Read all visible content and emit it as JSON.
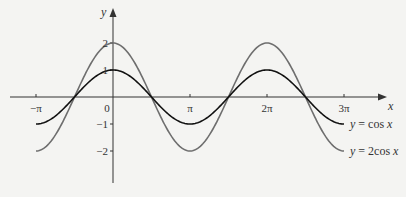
{
  "chart_data": {
    "type": "line",
    "title": "",
    "xlabel": "x",
    "ylabel": "y",
    "xlim_pi": [
      -1.3,
      3.55
    ],
    "ylim": [
      -3.2,
      3.5
    ],
    "grid": false,
    "x_ticks": [
      {
        "value_pi": -1,
        "label": "−π"
      },
      {
        "value_pi": 0,
        "label": "0"
      },
      {
        "value_pi": 1,
        "label": "π"
      },
      {
        "value_pi": 2,
        "label": "2π"
      },
      {
        "value_pi": 3,
        "label": "3π"
      }
    ],
    "y_ticks": [
      {
        "value": 2,
        "label": "2"
      },
      {
        "value": 1,
        "label": "1"
      },
      {
        "value": -1,
        "label": "−1"
      },
      {
        "value": -2,
        "label": "−2"
      }
    ],
    "x_range_pi": [
      -1,
      3
    ],
    "series": [
      {
        "name": "y = cos x",
        "amplitude": 1,
        "color": "#111111",
        "legend": {
          "pre": "y",
          "eq": " = cos",
          "post": "x"
        }
      },
      {
        "name": "y = 2 cos x",
        "amplitude": 2,
        "color": "#6e6e6e",
        "legend": {
          "pre": "y",
          "eq": " = 2cos",
          "post": "x"
        }
      }
    ],
    "legend_placement": "right, labels attached to curve ends"
  }
}
